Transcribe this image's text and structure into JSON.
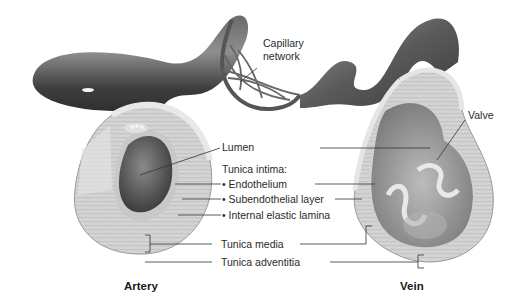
{
  "diagram": {
    "structures": {
      "artery": {
        "title": "Artery"
      },
      "vein": {
        "title": "Vein"
      }
    },
    "labels": {
      "capillary_network_line1": "Capillary",
      "capillary_network_line2": "network",
      "lumen": "Lumen",
      "tunica_intima": "Tunica intima:",
      "endothelium": "Endothelium",
      "subendothelial_layer": "Subendothelial layer",
      "internal_elastic_lamina": "Internal elastic lamina",
      "tunica_media": "Tunica media",
      "tunica_adventitia": "Tunica adventitia",
      "valve": "Valve"
    },
    "colors": {
      "vessel_dark": "#3a3a3a",
      "vessel_mid": "#7a7a7a",
      "wall_light": "#d9d9d9",
      "wall_mid": "#bdbdbd",
      "leader_line": "#333333",
      "text": "#2a2a2a"
    }
  }
}
